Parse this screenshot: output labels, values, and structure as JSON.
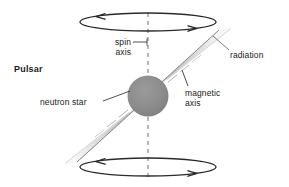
{
  "figure": {
    "title": "Pulsar",
    "background_color": "#ffffff",
    "ink_color": "#1a1a1a",
    "star_color": "#8a8a8a",
    "beam_color": "#cfcfcf"
  },
  "labels": {
    "pulsar": "Pulsar",
    "spin_axis_line1": "spin",
    "spin_axis_line2": "axis",
    "radiation": "radiation",
    "magnetic_axis_line1": "magnetic",
    "magnetic_axis_line2": "axis",
    "neutron_star": "neutron star"
  },
  "parts": {
    "spin_axis": "dashed-vertical-axis",
    "rotation_top": "rotation-ellipse-top",
    "rotation_bottom": "rotation-ellipse-bottom",
    "beam_upper": "radiation-beam-upper-right",
    "beam_lower": "radiation-beam-lower-left",
    "star": "neutron-star-sphere"
  }
}
